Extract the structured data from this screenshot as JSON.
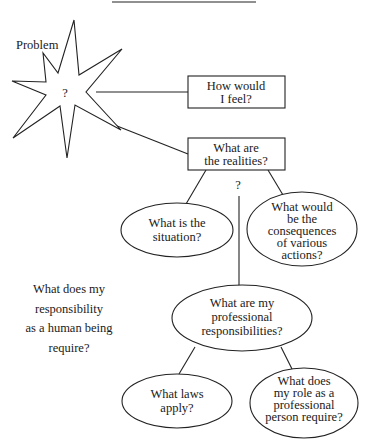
{
  "diagram": {
    "colors": {
      "stroke": "#222222",
      "text": "#1a1a1a",
      "background": "#ffffff"
    },
    "problem": {
      "label": "Problem",
      "center_mark": "?"
    },
    "boxes": [
      {
        "id": "feel",
        "lines": [
          "How would",
          "I feel?"
        ]
      },
      {
        "id": "realities",
        "lines": [
          "What are",
          "the realities?"
        ]
      }
    ],
    "branch_mark": "?",
    "ellipses": [
      {
        "id": "situation",
        "lines": [
          "What is the",
          "situation?"
        ]
      },
      {
        "id": "consequences",
        "lines": [
          "What would",
          "be  the",
          "consequences",
          "of various",
          "actions?"
        ]
      },
      {
        "id": "professional",
        "lines": [
          "What are my",
          "professional",
          "responsibilities?"
        ]
      },
      {
        "id": "laws",
        "lines": [
          "What laws",
          "apply?"
        ]
      },
      {
        "id": "role",
        "lines": [
          "What does",
          "my role as a",
          "professional",
          "person require?"
        ]
      }
    ],
    "free_text": {
      "lines": [
        "What does my",
        "responsibility",
        "as a human being",
        "require?"
      ]
    }
  }
}
